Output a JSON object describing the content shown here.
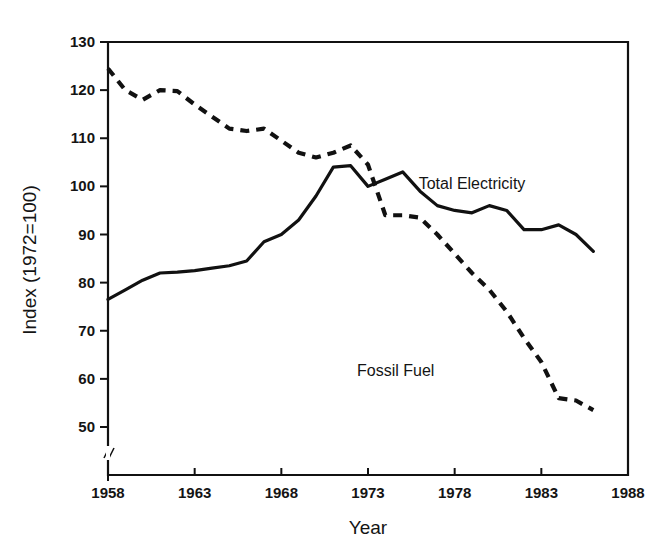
{
  "chart_data": {
    "type": "line",
    "title": "",
    "xlabel": "Year",
    "ylabel": "Index (1972=100)",
    "xlim": [
      1958,
      1988
    ],
    "ylim": [
      46,
      130
    ],
    "grid": false,
    "legend_position": "inline-annotation",
    "xticks": [
      "1958",
      "1963",
      "1968",
      "1973",
      "1978",
      "1983",
      "1988"
    ],
    "xtick_values": [
      1958,
      1963,
      1968,
      1973,
      1978,
      1983,
      1988
    ],
    "yticks": [
      "50",
      "60",
      "70",
      "80",
      "90",
      "100",
      "110",
      "120",
      "130"
    ],
    "ytick_values": [
      50,
      60,
      70,
      80,
      90,
      100,
      110,
      120,
      130
    ],
    "y_axis_break": true,
    "series": [
      {
        "name": "Total Electricity",
        "style": "solid",
        "color": "#111111",
        "x": [
          1958,
          1959,
          1960,
          1961,
          1962,
          1963,
          1964,
          1965,
          1966,
          1967,
          1968,
          1969,
          1970,
          1971,
          1972,
          1973,
          1974,
          1975,
          1976,
          1977,
          1978,
          1979,
          1980,
          1981,
          1982,
          1983,
          1984,
          1985,
          1986
        ],
        "values": [
          76.5,
          78.5,
          80.5,
          82.0,
          82.2,
          82.5,
          83.0,
          83.5,
          84.5,
          88.5,
          90.0,
          93.0,
          98.0,
          104.0,
          104.3,
          100.0,
          101.5,
          103.0,
          99.0,
          96.0,
          95.0,
          94.5,
          96.0,
          95.0,
          91.0,
          91.0,
          92.0,
          90.0,
          86.5
        ]
      },
      {
        "name": "Fossil Fuel",
        "style": "dashed",
        "color": "#111111",
        "x": [
          1958,
          1959,
          1960,
          1961,
          1962,
          1963,
          1964,
          1965,
          1966,
          1967,
          1968,
          1969,
          1970,
          1971,
          1972,
          1973,
          1974,
          1975,
          1976,
          1977,
          1978,
          1979,
          1980,
          1981,
          1982,
          1983,
          1984,
          1985,
          1986
        ],
        "values": [
          124.5,
          120.0,
          118.0,
          120.0,
          119.8,
          117.0,
          114.5,
          112.0,
          111.5,
          112.0,
          109.5,
          107.0,
          106.0,
          107.0,
          108.5,
          104.5,
          94.0,
          94.0,
          93.5,
          90.0,
          86.0,
          82.0,
          78.5,
          74.0,
          68.5,
          63.5,
          56.0,
          55.5,
          53.5
        ]
      }
    ],
    "annotations": [
      {
        "text": "Total Electricity",
        "x": 1979.0,
        "y": 99.5
      },
      {
        "text": "Fossil Fuel",
        "x": 1974.6,
        "y": 60.5
      }
    ]
  }
}
